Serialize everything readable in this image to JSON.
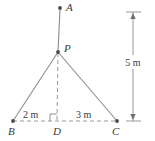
{
  "figure": {
    "type": "geometry-diagram",
    "background_color": "#ffffff",
    "line_color": "#8c8c8c",
    "dash_color": "#9a9a9a",
    "text_color": "#3a3a3a",
    "point_color": "#4a4a4a"
  },
  "points": {
    "A": {
      "label": "A",
      "x": 60,
      "y": 7
    },
    "P": {
      "label": "P",
      "x": 58,
      "y": 52
    },
    "B": {
      "label": "B",
      "x": 13,
      "y": 121
    },
    "D": {
      "label": "D",
      "x": 57,
      "y": 121
    },
    "C": {
      "label": "C",
      "x": 117,
      "y": 121
    }
  },
  "labels": {
    "A": "A",
    "P": "P",
    "B": "B",
    "D": "D",
    "C": "C"
  },
  "measurements": {
    "bd": "2 m",
    "dc": "3 m",
    "height": "5 m"
  },
  "segments": {
    "mast_AP": {
      "style": "solid",
      "from": "A",
      "to": "P"
    },
    "side_PB": {
      "style": "solid",
      "from": "P",
      "to": "B"
    },
    "side_PC": {
      "style": "solid",
      "from": "P",
      "to": "C"
    },
    "altitude_PD": {
      "style": "dashed",
      "from": "P",
      "to": "D"
    },
    "base_BC": {
      "style": "dashed",
      "from": "B",
      "to": "C"
    }
  },
  "markers": {
    "right_angle_at_D": "right-angle-square"
  },
  "dimension_line": {
    "label": "5 m",
    "x": 133,
    "top_y": 12,
    "bottom_y": 121,
    "arrow_top": "up",
    "arrow_bottom": "down"
  }
}
